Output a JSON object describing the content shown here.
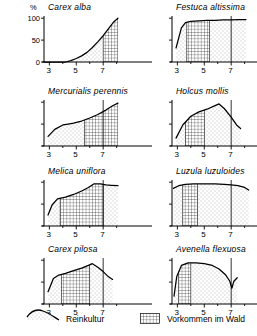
{
  "figure": {
    "y_axis": {
      "unit": "%",
      "ticks": [
        "100",
        "50",
        "0"
      ]
    },
    "x_axis": {
      "label": "pH",
      "ticks": [
        "3",
        "5",
        "7"
      ]
    }
  },
  "legend": {
    "items": [
      {
        "key": "pure-culture",
        "label": "Reinkultur",
        "pattern": "curve-with-dots"
      },
      {
        "key": "forest-occurrence",
        "label": "Vorkommen im Wald",
        "pattern": "grid-hatch"
      }
    ]
  },
  "chart_data": [
    {
      "type": "area",
      "title": "Carex alba",
      "xlabel": "pH",
      "ylabel": "%",
      "xlim": [
        2.6,
        8.4
      ],
      "ylim": [
        0,
        105
      ],
      "x": [
        2.6,
        3.5,
        4.2,
        4.6,
        5.0,
        5.4,
        5.8,
        6.2,
        6.6,
        7.0,
        7.4,
        7.8,
        8.1
      ],
      "values": [
        0,
        0,
        0,
        3,
        8,
        14,
        22,
        33,
        46,
        60,
        76,
        92,
        100
      ],
      "hatch_range": [
        7.0,
        8.1
      ],
      "vline": null
    },
    {
      "type": "area",
      "title": "Festuca altissima",
      "xlabel": "pH",
      "ylabel": "%",
      "xlim": [
        2.6,
        8.4
      ],
      "ylim": [
        0,
        105
      ],
      "x": [
        2.9,
        3.1,
        3.3,
        3.6,
        4.0,
        4.6,
        5.2,
        5.8,
        6.4,
        7.0,
        7.6,
        8.1
      ],
      "values": [
        32,
        55,
        78,
        90,
        93,
        94,
        95,
        95,
        96,
        96,
        97,
        97
      ],
      "hatch_range": [
        3.7,
        5.4
      ],
      "vline": 7.0
    },
    {
      "type": "area",
      "title": "Mercurialis perennis",
      "xlabel": "pH",
      "ylabel": "%",
      "xlim": [
        2.6,
        8.4
      ],
      "ylim": [
        0,
        105
      ],
      "x": [
        2.9,
        3.4,
        4.0,
        4.4,
        4.8,
        5.4,
        6.0,
        6.6,
        7.2,
        7.7,
        8.1
      ],
      "values": [
        22,
        38,
        48,
        50,
        52,
        57,
        64,
        72,
        82,
        92,
        98
      ],
      "hatch_range": [
        5.6,
        8.1
      ],
      "vline": 7.0
    },
    {
      "type": "area",
      "title": "Holcus mollis",
      "xlabel": "pH",
      "ylabel": "%",
      "xlim": [
        2.6,
        8.4
      ],
      "ylim": [
        0,
        105
      ],
      "x": [
        2.9,
        3.4,
        4.0,
        4.6,
        5.2,
        5.8,
        6.1,
        6.5,
        7.0,
        7.4,
        7.7
      ],
      "values": [
        18,
        48,
        68,
        78,
        84,
        92,
        96,
        85,
        66,
        48,
        40
      ],
      "hatch_range": [
        3.6,
        5.0
      ],
      "vline": 7.0
    },
    {
      "type": "area",
      "title": "Melica uniflora",
      "xlabel": "pH",
      "ylabel": "%",
      "xlim": [
        2.6,
        8.4
      ],
      "ylim": [
        0,
        105
      ],
      "x": [
        2.9,
        3.2,
        3.6,
        4.2,
        4.8,
        5.4,
        5.9,
        6.3,
        6.8,
        7.2,
        7.6,
        8.1
      ],
      "values": [
        25,
        48,
        62,
        66,
        72,
        80,
        88,
        96,
        96,
        94,
        93,
        92
      ],
      "hatch_range": [
        3.8,
        7.0
      ],
      "vline": 7.0
    },
    {
      "type": "area",
      "title": "Luzula luzuloides",
      "xlabel": "pH",
      "ylabel": "%",
      "xlim": [
        2.6,
        8.4
      ],
      "ylim": [
        0,
        105
      ],
      "x": [
        2.7,
        3.1,
        3.6,
        4.2,
        5.0,
        5.8,
        6.5,
        7.0,
        7.5,
        8.0,
        8.3
      ],
      "values": [
        86,
        92,
        95,
        96,
        96,
        96,
        95,
        94,
        92,
        88,
        82
      ],
      "hatch_range": [
        3.4,
        4.5
      ],
      "vline": 7.0
    },
    {
      "type": "area",
      "title": "Carex pilosa",
      "xlabel": "pH",
      "ylabel": "%",
      "xlim": [
        2.6,
        8.4
      ],
      "ylim": [
        0,
        105
      ],
      "x": [
        2.9,
        3.3,
        3.7,
        4.2,
        4.8,
        5.4,
        5.9,
        6.2,
        6.6,
        7.0,
        7.4,
        7.7
      ],
      "values": [
        28,
        58,
        66,
        70,
        76,
        82,
        88,
        92,
        84,
        74,
        62,
        56
      ],
      "hatch_range": [
        3.9,
        6.0
      ],
      "vline": 7.0
    },
    {
      "type": "area",
      "title": "Avenella flexuosa",
      "xlabel": "pH",
      "ylabel": "%",
      "xlim": [
        2.6,
        8.4
      ],
      "ylim": [
        0,
        105
      ],
      "x": [
        2.75,
        2.95,
        3.3,
        3.8,
        4.4,
        5.0,
        5.6,
        6.1,
        6.6,
        6.9,
        7.05,
        7.2,
        7.45
      ],
      "values": [
        18,
        62,
        88,
        94,
        94,
        92,
        88,
        80,
        66,
        52,
        36,
        52,
        60
      ],
      "hatch_range": [
        3.1,
        4.0
      ],
      "vline": 7.0
    }
  ]
}
